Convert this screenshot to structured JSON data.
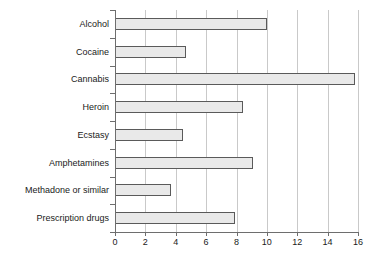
{
  "chart_data": {
    "type": "bar",
    "orientation": "horizontal",
    "title": "",
    "subtitle": "",
    "xlabel": "",
    "ylabel": "",
    "categories": [
      "Alcohol",
      "Cocaine",
      "Cannabis",
      "Heroin",
      "Ecstasy",
      "Amphetamines",
      "Methadone or similar",
      "Prescription drugs"
    ],
    "values": [
      10.0,
      4.7,
      15.8,
      8.4,
      4.5,
      9.1,
      3.7,
      7.9
    ],
    "xlim": [
      0,
      16
    ],
    "xticks": [
      0,
      2,
      4,
      6,
      8,
      10,
      12,
      14,
      16
    ],
    "xtick_labels": [
      "0",
      "2",
      "4",
      "6",
      "8",
      "10",
      "12",
      "14",
      "16"
    ],
    "grid": "vertical",
    "legend": "none",
    "bar_fill_color": "#e9e9e9",
    "bar_border_color": "#5a5a5a",
    "axis_color": "#6e6e6e",
    "gridline_color": "#c9c9c9",
    "text_color": "#1a1a1a"
  }
}
